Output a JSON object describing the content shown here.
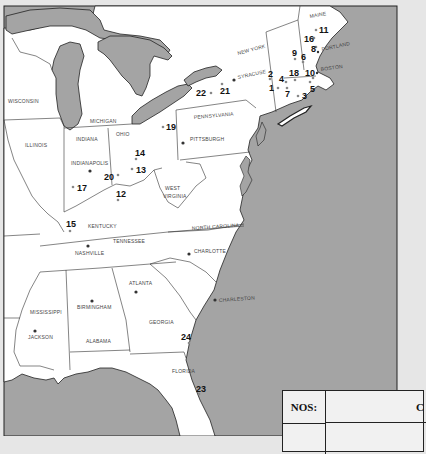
{
  "map": {
    "colors": {
      "water": "#a4a4a4",
      "land": "#ffffff",
      "border": "#333333",
      "frame_bg": "#e6e6e6"
    },
    "states": [
      {
        "name": "WISCONSIN",
        "x": 8,
        "y": 103
      },
      {
        "name": "MICHIGAN",
        "x": 90,
        "y": 123
      },
      {
        "name": "ILLINOIS",
        "x": 25,
        "y": 147
      },
      {
        "name": "INDIANA",
        "x": 76,
        "y": 141
      },
      {
        "name": "OHIO",
        "x": 116,
        "y": 136
      },
      {
        "name": "PENNSYLVANIA",
        "x": 194,
        "y": 119
      },
      {
        "name": "NEW YORK",
        "x": 238,
        "y": 55
      },
      {
        "name": "MAINE",
        "x": 310,
        "y": 18
      },
      {
        "name": "WEST",
        "x": 165,
        "y": 190
      },
      {
        "name": "VIRGINIA",
        "x": 163,
        "y": 198
      },
      {
        "name": "KENTUCKY",
        "x": 88,
        "y": 228
      },
      {
        "name": "TENNESSEE",
        "x": 113,
        "y": 243
      },
      {
        "name": "NORTH CAROLINA",
        "x": 192,
        "y": 230
      },
      {
        "name": "MISSISSIPPI",
        "x": 30,
        "y": 314
      },
      {
        "name": "ALABAMA",
        "x": 86,
        "y": 343
      },
      {
        "name": "GEORGIA",
        "x": 149,
        "y": 324
      },
      {
        "name": "FLORIDA",
        "x": 172,
        "y": 373
      }
    ],
    "cities": [
      {
        "name": "SYRACUSE",
        "x": 234,
        "y": 80,
        "dx": 4,
        "dy": -1
      },
      {
        "name": "PORTLAND",
        "x": 318,
        "y": 52,
        "dx": 4,
        "dy": -1
      },
      {
        "name": "BOSTON",
        "x": 317,
        "y": 73,
        "dx": 4,
        "dy": -2
      },
      {
        "name": "PITTSBURGH",
        "x": 183,
        "y": 143,
        "dx": 7,
        "dy": -2
      },
      {
        "name": "INDIANAPOLIS",
        "x": 90,
        "y": 171,
        "dx": -19,
        "dy": -6
      },
      {
        "name": "NASHVILLE",
        "x": 88,
        "y": 246,
        "dx": -13,
        "dy": 9
      },
      {
        "name": "CHARLOTTE",
        "x": 189,
        "y": 254,
        "dx": 5,
        "dy": -1
      },
      {
        "name": "ATLANTA",
        "x": 136,
        "y": 292,
        "dx": -7,
        "dy": -7
      },
      {
        "name": "BIRMINGHAM",
        "x": 92,
        "y": 301,
        "dx": -15,
        "dy": 8
      },
      {
        "name": "JACKSON",
        "x": 35,
        "y": 331,
        "dx": -7,
        "dy": 8
      },
      {
        "name": "CHARLESTON",
        "x": 215,
        "y": 300,
        "dx": 4,
        "dy": 2
      }
    ],
    "markers": [
      {
        "n": "1",
        "x": 278,
        "y": 88,
        "lx": 269,
        "ly": 91
      },
      {
        "n": "2",
        "x": 270,
        "y": 78,
        "lx": 268,
        "ly": 77
      },
      {
        "n": "3",
        "x": 298,
        "y": 95,
        "lx": 303,
        "ly": 99
      },
      {
        "n": "4",
        "x": 285,
        "y": 81,
        "lx": 279,
        "ly": 81
      },
      {
        "n": "5",
        "x": 310,
        "y": 81,
        "lx": 309,
        "ly": 92
      },
      {
        "name_note": "",
        "n": "6",
        "x": 303,
        "y": 62,
        "lx": 301,
        "ly": 61
      },
      {
        "n": "7",
        "x": 287,
        "y": 89,
        "lx": 284,
        "ly": 97
      },
      {
        "n": "8",
        "x": 316,
        "y": 47,
        "lx": 311,
        "ly": 52
      },
      {
        "n": "9",
        "x": 295,
        "y": 59,
        "lx": 292,
        "ly": 57
      },
      {
        "n": "10",
        "x": 313,
        "y": 79,
        "lx": 306,
        "ly": 76
      },
      {
        "n": "11",
        "x": 316,
        "y": 30,
        "lx": 319,
        "ly": 33
      },
      {
        "n": "12",
        "x": 118,
        "y": 200,
        "lx": 117,
        "ly": 197
      },
      {
        "n": "13",
        "x": 132,
        "y": 169,
        "lx": 136,
        "ly": 173
      },
      {
        "n": "14",
        "x": 135,
        "y": 159,
        "lx": 136,
        "ly": 157
      },
      {
        "n": "15",
        "x": 70,
        "y": 230,
        "lx": 67,
        "ly": 227
      },
      {
        "n": "16",
        "x": 314,
        "y": 38,
        "lx": 305,
        "ly": 42
      },
      {
        "n": "17",
        "x": 73,
        "y": 187,
        "lx": 77,
        "ly": 191
      },
      {
        "name_note": "",
        "n": "18",
        "x": 294,
        "y": 80,
        "lx": 289,
        "ly": 76
      },
      {
        "n": "19",
        "x": 163,
        "y": 127,
        "lx": 166,
        "ly": 130
      },
      {
        "n": "20",
        "x": 118,
        "y": 175,
        "lx": 105,
        "ly": 180
      },
      {
        "n": "21",
        "x": 222,
        "y": 84,
        "lx": 220,
        "ly": 94
      },
      {
        "n": "22",
        "x": 211,
        "y": 92,
        "lx": 196,
        "ly": 96
      },
      {
        "n": "23",
        "x": 199,
        "y": 394,
        "lx": 196,
        "ly": 392
      },
      {
        "n": "24",
        "x": 189,
        "y": 344,
        "lx": 181,
        "ly": 340
      }
    ]
  },
  "table": {
    "headers": [
      "NOS:",
      "C"
    ]
  }
}
